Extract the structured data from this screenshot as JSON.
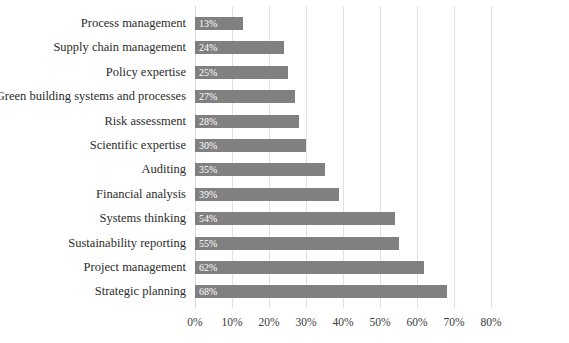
{
  "chart_data": {
    "type": "bar",
    "orientation": "horizontal",
    "title": "",
    "subtitle": "",
    "xlabel": "",
    "ylabel": "",
    "xlim": [
      0,
      80
    ],
    "xtick_labels": [
      "0%",
      "10%",
      "20%",
      "30%",
      "40%",
      "50%",
      "60%",
      "70%",
      "80%"
    ],
    "xtick_values": [
      0,
      10,
      20,
      30,
      40,
      50,
      60,
      70,
      80
    ],
    "grid": true,
    "legend": false,
    "legend_position": "none",
    "bar_color": "#808080",
    "gridline_color": "#e2e2e2",
    "data_label_color": "#ffffff",
    "categories": [
      "Process management",
      "Supply chain management",
      "Policy expertise",
      "Green building systems and processes",
      "Risk assessment",
      "Scientific expertise",
      "Auditing",
      "Financial analysis",
      "Systems thinking",
      "Sustainability reporting",
      "Project management",
      "Strategic planning"
    ],
    "values": [
      13,
      24,
      25,
      27,
      28,
      30,
      35,
      39,
      54,
      55,
      62,
      68
    ],
    "data_labels": [
      "13%",
      "24%",
      "25%",
      "27%",
      "28%",
      "30%",
      "35%",
      "39%",
      "54%",
      "55%",
      "62%",
      "68%"
    ]
  }
}
